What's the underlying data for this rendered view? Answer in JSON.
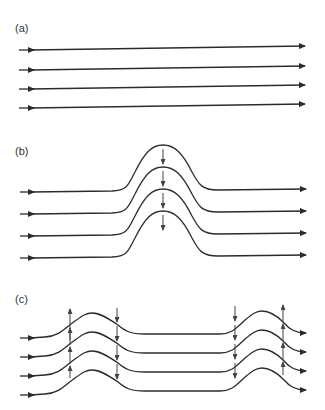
{
  "figure": {
    "line_color": "#2b2b2b",
    "arrow_color": "#444444",
    "panels": [
      {
        "id": "a",
        "label": "(a)",
        "description": "Uniform straight horizontal flow lines",
        "num_lines": 4,
        "flow_arrow_direction": "right",
        "vertical_arrows": []
      },
      {
        "id": "b",
        "label": "(b)",
        "description": "Flow lines deflected upward over a single bump with downward arrows at the crest",
        "num_lines": 4,
        "flow_arrow_direction": "right",
        "vertical_arrows": [
          {
            "position": "crest",
            "direction": "down",
            "count": 4
          }
        ]
      },
      {
        "id": "c",
        "label": "(c)",
        "description": "Flow lines with two bumps; upward arrows on rising flanks and downward arrows on descending/approach flanks",
        "num_lines": 4,
        "flow_arrow_direction": "right",
        "vertical_arrows": [
          {
            "position": "first bump rising flank",
            "direction": "up",
            "count": 4
          },
          {
            "position": "first bump falling flank",
            "direction": "down",
            "count": 4
          },
          {
            "position": "second bump rising flank",
            "direction": "down",
            "count": 4
          },
          {
            "position": "second bump falling flank",
            "direction": "up",
            "count": 4
          }
        ]
      }
    ]
  }
}
